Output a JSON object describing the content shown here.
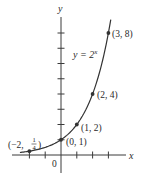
{
  "chart_data": {
    "type": "line",
    "title": "",
    "function_label": "y = 2^x",
    "function_label_parts": {
      "base": "y = 2",
      "exponent": "x"
    },
    "xlabel": "x",
    "ylabel": "y",
    "origin_label": "0",
    "xlim": [
      -3,
      3.6
    ],
    "ylim": [
      -1.1,
      9
    ],
    "x_ticks": [
      -2,
      -1,
      1,
      2,
      3
    ],
    "y_ticks": [
      1,
      2,
      3,
      4,
      5,
      6,
      7,
      8
    ],
    "grid": false,
    "legend": null,
    "series": [
      {
        "name": "y = 2^x",
        "x_range": [
          -2.6,
          3.15
        ],
        "color": "#333333"
      }
    ],
    "points": [
      {
        "x": -2,
        "y": 0.25,
        "label": "(−2, 1/4)",
        "label_parts": {
          "prefix": "(−2, ",
          "num": "1",
          "den": "4",
          "suffix": ")"
        }
      },
      {
        "x": 0,
        "y": 1,
        "label": "(0, 1)"
      },
      {
        "x": 1,
        "y": 2,
        "label": "(1, 2)"
      },
      {
        "x": 2,
        "y": 4,
        "label": "(2, 4)"
      },
      {
        "x": 3,
        "y": 8,
        "label": "(3, 8)"
      }
    ]
  },
  "colors": {
    "axis": "#3a3a3a",
    "curve": "#333333",
    "point": "#333333",
    "text": "#2a2a2a"
  }
}
